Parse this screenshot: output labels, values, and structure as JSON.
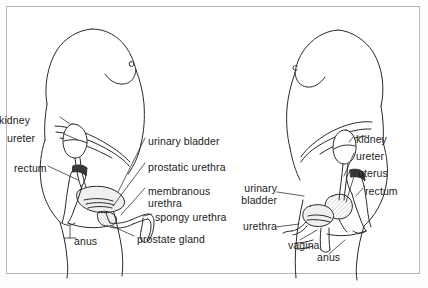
{
  "figure": {
    "type": "anatomical-line-diagram",
    "panels": [
      {
        "id": "male",
        "name": "male-urinary-system",
        "labels": [
          {
            "key": "kidney",
            "text": "kidney",
            "x": 30,
            "y": 115,
            "anchor": "right"
          },
          {
            "key": "ureter",
            "text": "ureter",
            "x": 35,
            "y": 133,
            "anchor": "right"
          },
          {
            "key": "rectum",
            "text": "rectum",
            "x": 14,
            "y": 163,
            "anchor": "right"
          },
          {
            "key": "anus",
            "text": "anus",
            "x": 74,
            "y": 236,
            "anchor": "right"
          },
          {
            "key": "urinary_bladder",
            "text": "urinary bladder",
            "x": 148,
            "y": 136,
            "anchor": "left"
          },
          {
            "key": "prostatic_urethra",
            "text": "prostatic urethra",
            "x": 148,
            "y": 162,
            "anchor": "left"
          },
          {
            "key": "membranous_urethra",
            "text": "membranous\nurethra",
            "x": 148,
            "y": 186,
            "anchor": "left"
          },
          {
            "key": "spongy_urethra",
            "text": "spongy urethra",
            "x": 155,
            "y": 212,
            "anchor": "left"
          },
          {
            "key": "prostate_gland",
            "text": "prostate gland",
            "x": 137,
            "y": 234,
            "anchor": "left"
          }
        ]
      },
      {
        "id": "female",
        "name": "female-urinary-system",
        "labels": [
          {
            "key": "kidney",
            "text": "kidney",
            "x": 356,
            "y": 134,
            "anchor": "left"
          },
          {
            "key": "ureter",
            "text": "ureter",
            "x": 356,
            "y": 151,
            "anchor": "left"
          },
          {
            "key": "uterus",
            "text": "uterus",
            "x": 358,
            "y": 168,
            "anchor": "left"
          },
          {
            "key": "rectum",
            "text": "rectum",
            "x": 365,
            "y": 186,
            "anchor": "left"
          },
          {
            "key": "urinary_bladder",
            "text": "urinary\nbladder",
            "x": 242,
            "y": 183,
            "anchor": "right"
          },
          {
            "key": "urethra",
            "text": "urethra",
            "x": 244,
            "y": 225,
            "anchor": "right"
          },
          {
            "key": "vagina",
            "text": "vagina",
            "x": 288,
            "y": 240,
            "anchor": "left"
          },
          {
            "key": "anus",
            "text": "anus",
            "x": 317,
            "y": 256,
            "anchor": "left"
          }
        ]
      }
    ],
    "colors": {
      "ink": "#1b1b1b",
      "line": "#2a2a2a",
      "border": "#b9b9b9",
      "background": "#ffffff",
      "shade": "#d8d8d8"
    }
  }
}
